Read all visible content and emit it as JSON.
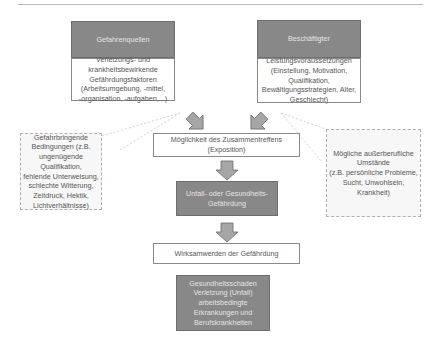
{
  "diagram": {
    "sources": {
      "header": "Gefahrenquellen",
      "body": "Verletzungs- und\nkrankheitsbewirkende\nGefährdungsfaktoren\n(Arbeitsumgebung, -mittel,\n-organisation, -aufgaben,...)"
    },
    "employees": {
      "header": "Beschäftigter",
      "body": "Leistungsvoraussetzungen\n(Einstellung, Motivation,\nQualifikation,\nBewältigungsstrategien, Alter,\nGeschlecht)"
    },
    "left_callout": "Gefahrbringende\nBedingungen (z.B.\nungenügende Qualifikation,\nfehlende Unterweisung,\nschlechte Witterung,\nZeitdruck, Hektik,\nLichtverhältnisse)",
    "right_callout": "Mögliche außerberufliche\nUmstände\n(z.B. persönliche Probleme,\nSucht, Unwohlsein,\nKrankheit)",
    "exposure": "Möglichkeit des Zusammentreffens\n(Exposition)",
    "hazard": "Unfall- oder Gesundheits-\nGefährdung",
    "effect": "Wirksamwerden der Gefährdung",
    "outcome": "Gesundheitsschaden\nVerletzung (Unfall)\narbeitsbedingte\nErkrankungen und\nBerufskrankheiten"
  },
  "colors": {
    "dark_box": "#888888",
    "arrow_fill": "#a6a6a6",
    "border": "#8a8a8a"
  }
}
